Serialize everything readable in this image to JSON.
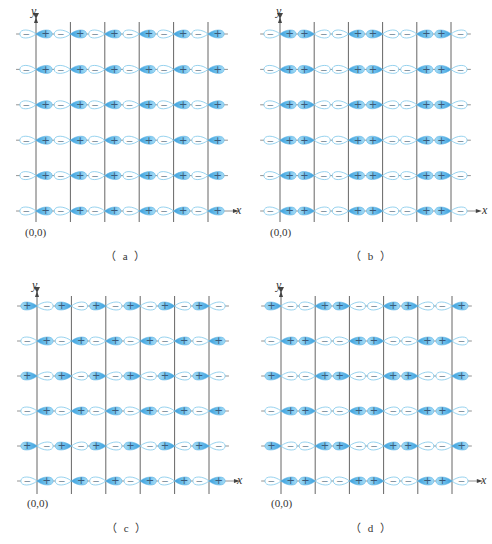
{
  "figure": {
    "colors": {
      "fill_dark": "#3c9fdc",
      "fill_light": "#a9dcf4",
      "outline": "#7cc6ea",
      "axis": "#666666",
      "sign_text": "#3a5a78"
    },
    "labels": {
      "origin": "(0,0)",
      "x_axis": "x",
      "y_axis": "y",
      "plus": "+",
      "minus": "−"
    },
    "panels": [
      {
        "id": "a",
        "caption": "（ a ）",
        "origin_label": "(0,0)",
        "x_label": "x",
        "y_label": "y",
        "row_orientations": [
          [
            "-+",
            "-+",
            "-+",
            "-+",
            "-+",
            "-+"
          ],
          [
            "-+",
            "-+",
            "-+",
            "-+",
            "-+",
            "-+"
          ],
          [
            "-+",
            "-+",
            "-+",
            "-+",
            "-+",
            "-+"
          ],
          [
            "-+",
            "-+",
            "-+",
            "-+",
            "-+",
            "-+"
          ],
          [
            "-+",
            "-+",
            "-+",
            "-+",
            "-+",
            "-+"
          ],
          [
            "-+",
            "-+",
            "-+",
            "-+",
            "-+",
            "-+"
          ]
        ]
      },
      {
        "id": "b",
        "caption": "（ b ）",
        "origin_label": "(0,0)",
        "x_label": "x",
        "y_label": "y",
        "row_orientations": [
          [
            "-+",
            "+-",
            "-+",
            "+-",
            "-+",
            "+-"
          ],
          [
            "-+",
            "+-",
            "-+",
            "+-",
            "-+",
            "+-"
          ],
          [
            "-+",
            "+-",
            "-+",
            "+-",
            "-+",
            "+-"
          ],
          [
            "-+",
            "+-",
            "-+",
            "+-",
            "-+",
            "+-"
          ],
          [
            "-+",
            "+-",
            "-+",
            "+-",
            "-+",
            "+-"
          ],
          [
            "-+",
            "+-",
            "-+",
            "+-",
            "-+",
            "+-"
          ]
        ]
      },
      {
        "id": "c",
        "caption": "（ c ）",
        "origin_label": "(0,0)",
        "x_label": "x",
        "y_label": "y",
        "row_orientations": [
          [
            "+-",
            "+-",
            "+-",
            "+-",
            "+-",
            "+-"
          ],
          [
            "-+",
            "-+",
            "-+",
            "-+",
            "-+",
            "-+"
          ],
          [
            "+-",
            "+-",
            "+-",
            "+-",
            "+-",
            "+-"
          ],
          [
            "-+",
            "-+",
            "-+",
            "-+",
            "-+",
            "-+"
          ],
          [
            "+-",
            "+-",
            "+-",
            "+-",
            "+-",
            "+-"
          ],
          [
            "-+",
            "-+",
            "-+",
            "-+",
            "-+",
            "-+"
          ]
        ]
      },
      {
        "id": "d",
        "caption": "（ d ）",
        "origin_label": "(0,0)",
        "x_label": "x",
        "y_label": "y",
        "row_orientations": [
          [
            "+-",
            "-+",
            "+-",
            "-+",
            "+-",
            "-+"
          ],
          [
            "-+",
            "+-",
            "-+",
            "+-",
            "-+",
            "+-"
          ],
          [
            "+-",
            "-+",
            "+-",
            "-+",
            "+-",
            "-+"
          ],
          [
            "-+",
            "+-",
            "-+",
            "+-",
            "-+",
            "+-"
          ],
          [
            "+-",
            "-+",
            "+-",
            "-+",
            "+-",
            "-+"
          ],
          [
            "-+",
            "+-",
            "-+",
            "+-",
            "-+",
            "+-"
          ]
        ]
      }
    ]
  }
}
